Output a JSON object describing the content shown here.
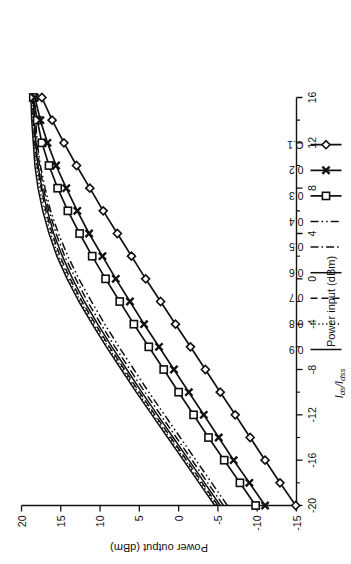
{
  "chart_data": {
    "type": "line",
    "title": "",
    "xlabel": "Power input  (dBm)",
    "ylabel": "Power output  (dBm)",
    "xlim": [
      -20,
      16
    ],
    "ylim": [
      -15,
      20
    ],
    "xticks": [
      -20,
      -16,
      -12,
      -8,
      -4,
      0,
      4,
      8,
      12,
      16
    ],
    "xticklabels": [
      "-20",
      "-16",
      "-12",
      "-8",
      "-4",
      "0",
      "4",
      "8",
      "12",
      "16"
    ],
    "xminor_step": 2,
    "yticks": [
      -15,
      -10,
      -5,
      0,
      5,
      10,
      15,
      20
    ],
    "yticklabels": [
      "-15",
      "-10",
      "-5",
      "0",
      "5",
      "10",
      "15",
      "20"
    ],
    "grid": false,
    "legend_position": "outside-top",
    "legend_title": "I ds / I dss",
    "legend_title_parts": {
      "i1": "I",
      "sub1": "ds",
      "slash": "/",
      "i2": "I",
      "sub2": "dss"
    },
    "x": [
      -20,
      -18,
      -16,
      -14,
      -12,
      -10,
      -8,
      -6,
      -4,
      -2,
      0,
      2,
      4,
      6,
      8,
      10,
      12,
      14,
      16
    ],
    "series": [
      {
        "name": "0.9",
        "style": "solid",
        "marker": "none",
        "values": [
          -4.6,
          -2.6,
          -0.6,
          1.4,
          3.4,
          5.4,
          7.3,
          9.2,
          11.0,
          12.7,
          14.2,
          15.5,
          16.5,
          17.3,
          17.9,
          18.3,
          18.5,
          18.7,
          18.8
        ]
      },
      {
        "name": "0.8",
        "style": "dotted",
        "marker": "none",
        "values": [
          -4.8,
          -2.8,
          -0.8,
          1.2,
          3.2,
          5.2,
          7.1,
          9.0,
          10.8,
          12.5,
          14.0,
          15.3,
          16.3,
          17.1,
          17.7,
          18.1,
          18.4,
          18.6,
          18.7
        ]
      },
      {
        "name": "0 7",
        "style": "dashed",
        "marker": "none",
        "values": [
          -5.0,
          -3.0,
          -1.0,
          1.0,
          3.0,
          5.0,
          6.9,
          8.8,
          10.6,
          12.3,
          13.8,
          15.1,
          16.1,
          16.9,
          17.5,
          18.0,
          18.3,
          18.5,
          18.6
        ]
      },
      {
        "name": "0.6",
        "style": "solid",
        "marker": "none",
        "values": [
          -5.3,
          -3.3,
          -1.3,
          0.7,
          2.7,
          4.7,
          6.6,
          8.5,
          10.3,
          12.0,
          13.5,
          14.8,
          15.9,
          16.7,
          17.4,
          17.9,
          18.2,
          18.4,
          18.5
        ]
      },
      {
        "name": "0.5",
        "style": "dashdot",
        "marker": "none",
        "values": [
          -5.7,
          -3.7,
          -1.7,
          0.3,
          2.3,
          4.3,
          6.2,
          8.1,
          9.9,
          11.6,
          13.1,
          14.5,
          15.6,
          16.5,
          17.2,
          17.7,
          18.1,
          18.3,
          18.4
        ]
      },
      {
        "name": "0.4",
        "style": "dashdotdot",
        "marker": "none",
        "values": [
          -6.2,
          -4.2,
          -2.2,
          -0.2,
          1.8,
          3.8,
          5.7,
          7.6,
          9.4,
          11.1,
          12.7,
          14.1,
          15.3,
          16.3,
          17.0,
          17.6,
          18.0,
          18.2,
          18.3
        ]
      },
      {
        "name": "0.3",
        "style": "solid",
        "marker": "square",
        "values": [
          -9.8,
          -7.8,
          -5.8,
          -3.8,
          -1.9,
          0.0,
          1.9,
          3.8,
          5.7,
          7.5,
          9.3,
          11.0,
          12.6,
          14.1,
          15.4,
          16.5,
          17.4,
          18.0,
          18.5
        ]
      },
      {
        "name": "0.2",
        "style": "solid",
        "marker": "x",
        "values": [
          -11.0,
          -9.0,
          -7.0,
          -5.1,
          -3.2,
          -1.3,
          0.6,
          2.5,
          4.4,
          6.2,
          8.0,
          9.7,
          11.4,
          12.9,
          14.3,
          15.6,
          16.7,
          17.6,
          18.3
        ]
      },
      {
        "name": "C.1",
        "style": "solid",
        "marker": "diamond",
        "values": [
          -14.9,
          -12.9,
          -11.0,
          -9.1,
          -7.2,
          -5.3,
          -3.4,
          -1.5,
          0.4,
          2.3,
          4.2,
          6.0,
          7.8,
          9.6,
          11.3,
          13.0,
          14.6,
          16.1,
          17.4
        ]
      }
    ]
  }
}
